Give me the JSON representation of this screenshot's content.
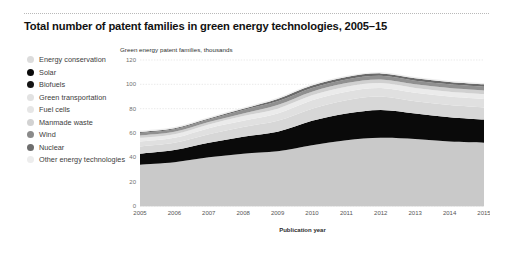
{
  "header": {
    "title": "Total number of patent families in green energy technologies, 2005–15"
  },
  "legend": {
    "items": [
      {
        "label": "Energy conservation",
        "color": "#dcdcdc"
      },
      {
        "label": "Solar",
        "color": "#0a0a0a"
      },
      {
        "label": "Biofuels",
        "color": "#141414"
      },
      {
        "label": "Green transportation",
        "color": "#e2e2e2"
      },
      {
        "label": "Fuel cells",
        "color": "#e6e6e6"
      },
      {
        "label": "Manmade waste",
        "color": "#d2d2d2"
      },
      {
        "label": "Wind",
        "color": "#8a8a8a"
      },
      {
        "label": "Nuclear",
        "color": "#6e6e6e"
      },
      {
        "label": "Other energy technologies",
        "color": "#ededed"
      }
    ]
  },
  "chart_data": {
    "type": "area",
    "stacked": true,
    "title": "Total number of patent families in green energy technologies, 2005–15",
    "subtitle": "",
    "xlabel": "Publication year",
    "ylabel": "Green energy patent families, thousands",
    "ylim": [
      0,
      120
    ],
    "yticks": [
      0,
      20,
      40,
      60,
      80,
      100,
      120
    ],
    "grid": true,
    "legend_position": "left",
    "categories": [
      "2005",
      "2006",
      "2007",
      "2008",
      "2009",
      "2010",
      "2011",
      "2012",
      "2013",
      "2014",
      "2015"
    ],
    "x": [
      2005,
      2006,
      2007,
      2008,
      2009,
      2010,
      2011,
      2012,
      2013,
      2014,
      2015
    ],
    "series": [
      {
        "name": "Energy conservation",
        "color": "#c9c9c9",
        "values": [
          34,
          36,
          40,
          43,
          45,
          50,
          54,
          56,
          55,
          53,
          52
        ]
      },
      {
        "name": "Solar",
        "color": "#0a0a0a",
        "values": [
          9,
          10,
          12,
          14,
          16,
          20,
          22,
          23,
          21,
          20,
          19
        ]
      },
      {
        "name": "Biofuels",
        "color": "#d7d7d7",
        "values": [
          6,
          6,
          7,
          8,
          9,
          10,
          11,
          11,
          10,
          10,
          10
        ]
      },
      {
        "name": "Green transportation",
        "color": "#e0e0e0",
        "values": [
          4,
          4,
          5,
          5,
          6,
          7,
          7,
          7,
          7,
          7,
          7
        ]
      },
      {
        "name": "Fuel cells",
        "color": "#ebebeb",
        "values": [
          3,
          3,
          3,
          4,
          4,
          4,
          4,
          4,
          4,
          4,
          4
        ]
      },
      {
        "name": "Manmade waste",
        "color": "#d0d0d0",
        "values": [
          2,
          2,
          2,
          2,
          3,
          3,
          3,
          3,
          3,
          3,
          3
        ]
      },
      {
        "name": "Wind",
        "color": "#909090",
        "values": [
          2,
          2,
          2,
          3,
          3,
          3,
          3,
          3,
          3,
          3,
          3
        ]
      },
      {
        "name": "Nuclear",
        "color": "#6a6a6a",
        "values": [
          1,
          1,
          1,
          1,
          2,
          2,
          2,
          2,
          2,
          2,
          2
        ]
      },
      {
        "name": "Other energy technologies",
        "color": "#ededed",
        "values": [
          1,
          1,
          1,
          1,
          1,
          1,
          1,
          1,
          1,
          1,
          1
        ]
      }
    ],
    "totals": [
      62,
      65,
      73,
      81,
      89,
      100,
      107,
      110,
      106,
      103,
      101
    ]
  }
}
